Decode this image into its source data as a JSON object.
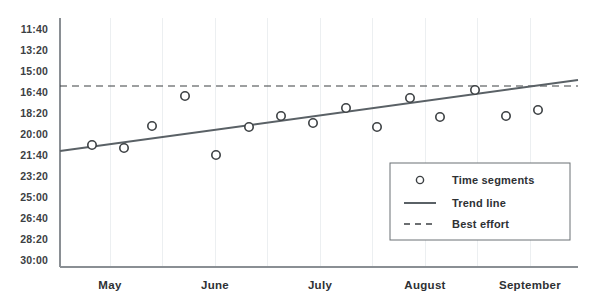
{
  "chart_data": {
    "type": "scatter",
    "title": "",
    "subtitle": "",
    "xlabel": "",
    "ylabel": "",
    "grid": true,
    "legend_position": "bottom-right",
    "x_categories": [
      "May",
      "June",
      "July",
      "August",
      "September"
    ],
    "x_tick_positions": [
      110,
      215,
      320,
      425,
      530
    ],
    "y_tick_labels": [
      "11:40",
      "13:20",
      "15:00",
      "16:40",
      "18:20",
      "20:00",
      "21:40",
      "23:20",
      "25:00",
      "26:40",
      "28:20",
      "30:00"
    ],
    "y_axis_inverted": true,
    "y_axis_top_value": "11:40",
    "y_axis_bottom_value": "30:00",
    "plot_area": {
      "left": 60,
      "right": 578,
      "top": 18,
      "bottom": 267
    },
    "vertical_gridlines_x": [
      110,
      162,
      215,
      267,
      320,
      372,
      425,
      477,
      530
    ],
    "series": [
      {
        "name": "Time segments",
        "type": "scatter",
        "marker": "open-circle",
        "color": "#3c4043",
        "points": [
          {
            "x": 92,
            "y": 145,
            "value": "20:25"
          },
          {
            "x": 124,
            "y": 148,
            "value": "20:40"
          },
          {
            "x": 152,
            "y": 126,
            "value": "18:55"
          },
          {
            "x": 185,
            "y": 96,
            "value": "16:55"
          },
          {
            "x": 216,
            "y": 155,
            "value": "21:10"
          },
          {
            "x": 249,
            "y": 127,
            "value": "19:00"
          },
          {
            "x": 281,
            "y": 116,
            "value": "18:10"
          },
          {
            "x": 313,
            "y": 123,
            "value": "18:40"
          },
          {
            "x": 346,
            "y": 108,
            "value": "17:35"
          },
          {
            "x": 377,
            "y": 127,
            "value": "19:00"
          },
          {
            "x": 410,
            "y": 98,
            "value": "17:00"
          },
          {
            "x": 440,
            "y": 117,
            "value": "18:15"
          },
          {
            "x": 475,
            "y": 90,
            "value": "16:25"
          },
          {
            "x": 506,
            "y": 116,
            "value": "18:10"
          },
          {
            "x": 538,
            "y": 110,
            "value": "17:50"
          }
        ]
      },
      {
        "name": "Trend line",
        "type": "line",
        "style": "solid",
        "color": "#5a6166",
        "start": {
          "x": 60,
          "y": 151
        },
        "end": {
          "x": 578,
          "y": 80
        }
      },
      {
        "name": "Best effort",
        "type": "line",
        "style": "dashed",
        "color": "#3c4043",
        "start": {
          "x": 60,
          "y": 86
        },
        "end": {
          "x": 578,
          "y": 86
        },
        "value": "15:50"
      }
    ]
  },
  "axes": {
    "y_ticks": [
      {
        "label": "11:40",
        "y": 29
      },
      {
        "label": "13:20",
        "y": 50
      },
      {
        "label": "15:00",
        "y": 71
      },
      {
        "label": "16:40",
        "y": 92
      },
      {
        "label": "18:20",
        "y": 113
      },
      {
        "label": "20:00",
        "y": 134
      },
      {
        "label": "21:40",
        "y": 155
      },
      {
        "label": "23:20",
        "y": 176
      },
      {
        "label": "25:00",
        "y": 197
      },
      {
        "label": "26:40",
        "y": 218
      },
      {
        "label": "28:20",
        "y": 239
      },
      {
        "label": "30:00",
        "y": 260
      }
    ],
    "x_ticks": [
      {
        "label": "May",
        "x": 110
      },
      {
        "label": "June",
        "x": 215
      },
      {
        "label": "July",
        "x": 320
      },
      {
        "label": "August",
        "x": 425
      },
      {
        "label": "September",
        "x": 530
      }
    ]
  },
  "legend": {
    "box": {
      "x": 390,
      "y": 163,
      "width": 180,
      "height": 77
    },
    "items": [
      {
        "label": "Time segments",
        "marker": "open-circle"
      },
      {
        "label": "Trend line",
        "marker": "solid-line"
      },
      {
        "label": "Best effort",
        "marker": "dashed-line"
      }
    ]
  },
  "colors": {
    "axis": "#8a8f94",
    "grid": "#eceff1",
    "text": "#2e3134",
    "marker_stroke": "#3c4043",
    "trend_line": "#5a6166",
    "best_effort": "#3c4043",
    "legend_border": "#6b7075",
    "background": "#ffffff"
  }
}
